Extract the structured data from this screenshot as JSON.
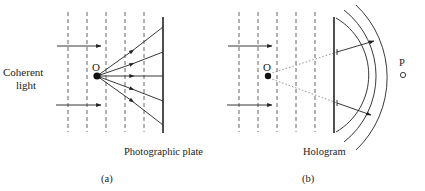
{
  "colors": {
    "ink": "#222222",
    "dashed": "#555555",
    "dotted": "#888888",
    "background": "#ffffff"
  },
  "panel_a": {
    "caption": "(a)",
    "source_label_line1": "Coherent",
    "source_label_line2": "light",
    "object_label": "O",
    "plate_label": "Photographic plate"
  },
  "panel_b": {
    "caption": "(b)",
    "object_label": "O",
    "plate_label": "Hologram",
    "observer_label": "P"
  }
}
